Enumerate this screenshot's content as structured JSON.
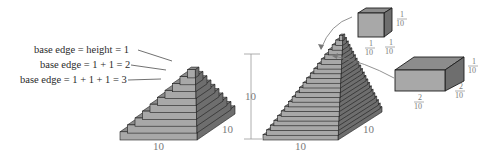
{
  "step_pyramid": {
    "labels": [
      "base edge = height = 1",
      "base edge = 1 + 1 = 2",
      "base edge = 1 + 1 + 1 = 3"
    ],
    "base_width_label": "10",
    "base_depth_label": "10",
    "layers": 10
  },
  "fine_pyramid": {
    "height_label": "10",
    "base_width_label": "10",
    "base_depth_label": "10",
    "layers": 22
  },
  "small_cube": {
    "height": {
      "num": "1",
      "den": "10"
    },
    "width": {
      "num": "1",
      "den": "10"
    },
    "depth": {
      "num": "1",
      "den": "10"
    }
  },
  "large_slab": {
    "height": {
      "num": "1",
      "den": "10"
    },
    "width": {
      "num": "2",
      "den": "10"
    },
    "depth": {
      "num": "2",
      "den": "10"
    }
  },
  "colors": {
    "front_face": "#a8a8a8",
    "top_face": "#8c8c8c",
    "side_face": "#6e6e6e",
    "outline": "#1e1e1e",
    "dimension_text": "#7a7a7a"
  }
}
